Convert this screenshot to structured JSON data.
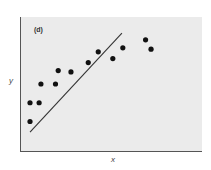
{
  "chart_data": {
    "type": "scatter",
    "title": "",
    "panel_label": "(d)",
    "xlabel": "x",
    "ylabel": "y",
    "grid": false,
    "legend": null,
    "xlim": [
      0,
      10
    ],
    "ylim": [
      0,
      10
    ],
    "points": [
      {
        "x": 0.55,
        "y": 2.2
      },
      {
        "x": 0.55,
        "y": 3.6
      },
      {
        "x": 1.05,
        "y": 3.6
      },
      {
        "x": 1.15,
        "y": 5.0
      },
      {
        "x": 1.95,
        "y": 5.0
      },
      {
        "x": 2.1,
        "y": 6.0
      },
      {
        "x": 2.8,
        "y": 5.9
      },
      {
        "x": 3.75,
        "y": 6.6
      },
      {
        "x": 4.3,
        "y": 7.4
      },
      {
        "x": 5.1,
        "y": 6.9
      },
      {
        "x": 5.65,
        "y": 7.7
      },
      {
        "x": 6.9,
        "y": 8.3
      },
      {
        "x": 7.2,
        "y": 7.6
      }
    ],
    "fit_line": {
      "x": [
        0.55,
        5.6
      ],
      "y": [
        1.4,
        8.8
      ]
    },
    "colors": {
      "background": "#ebebeb",
      "points": "#111111",
      "line": "#333333",
      "axis": "#555555"
    }
  },
  "labels": {
    "panel": "(d)",
    "x_axis": "x",
    "y_axis": "y"
  }
}
